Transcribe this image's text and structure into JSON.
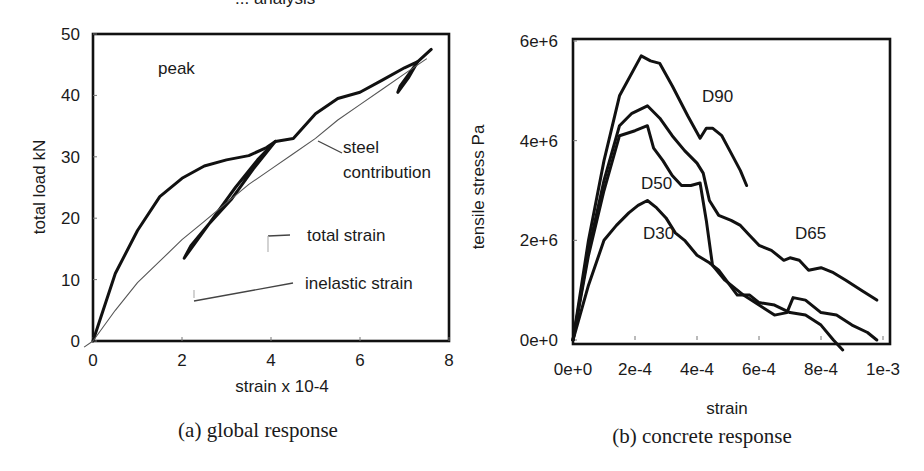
{
  "page_title_fragment": "... analysis",
  "chart_data": [
    {
      "type": "line",
      "caption": "(a) global response",
      "xlabel": "strain x 10-4",
      "ylabel": "total load  kN",
      "xlim": [
        0,
        8
      ],
      "ylim": [
        0,
        50
      ],
      "xticks": [
        "0",
        "2",
        "4",
        "6",
        "8"
      ],
      "yticks": [
        "0",
        "10",
        "20",
        "30",
        "40",
        "50"
      ],
      "grid": false,
      "annotations": [
        "peak",
        "steel contribution",
        "total strain",
        "inelastic strain"
      ],
      "series": [
        {
          "name": "total strain",
          "style": "thick",
          "x": [
            0,
            0.5,
            1.0,
            1.5,
            2.0,
            2.5,
            3.0,
            3.5,
            3.9,
            4.1,
            4.5,
            5.0,
            5.5,
            6.0,
            6.5,
            7.0,
            7.3,
            7.6
          ],
          "y": [
            0,
            11,
            18,
            23.5,
            26.5,
            28.5,
            29.5,
            30.2,
            31.5,
            32.5,
            33,
            37,
            39.5,
            40.5,
            42.5,
            44.5,
            45.5,
            47.5
          ]
        },
        {
          "name": "inelastic strain (unload/reload loop 1)",
          "style": "thick",
          "x": [
            4.1,
            3.6,
            3.1,
            2.6,
            2.2,
            2.05,
            2.2,
            2.7,
            3.2,
            3.7,
            4.1
          ],
          "y": [
            32.5,
            28,
            23,
            19,
            15.5,
            13.5,
            15,
            20,
            25,
            29.5,
            32.5
          ]
        },
        {
          "name": "inelastic strain (unload/reload loop 2)",
          "style": "thick",
          "x": [
            7.3,
            7.1,
            6.85,
            6.9,
            7.15,
            7.3
          ],
          "y": [
            45.5,
            43,
            40.5,
            41.5,
            44,
            45.5
          ]
        },
        {
          "name": "steel contribution",
          "style": "thin",
          "x": [
            -0.2,
            0,
            0.5,
            1.0,
            1.5,
            2.0,
            2.5,
            3.0,
            3.5,
            4.0,
            4.5,
            5.0,
            5.5,
            6.0,
            6.5,
            7.0,
            7.5
          ],
          "y": [
            -1,
            0,
            5,
            9.5,
            13,
            16.5,
            19.5,
            22.5,
            25.5,
            28,
            30.5,
            33,
            36,
            38.5,
            41,
            43.5,
            46
          ]
        }
      ]
    },
    {
      "type": "line",
      "caption": "(b) concrete response",
      "xlabel": "strain",
      "ylabel": "tensile  stress Pa",
      "xlim": [
        0,
        0.001
      ],
      "ylim": [
        0,
        6000000
      ],
      "xticks": [
        "0e+0",
        "2e-4",
        "4e-4",
        "6e-4",
        "8e-4",
        "1e-3"
      ],
      "yticks": [
        "0e+0",
        "2e+6",
        "4e+6",
        "6e+6"
      ],
      "grid": false,
      "series": [
        {
          "name": "D90",
          "x": [
            0,
            5e-05,
            0.0001,
            0.00015,
            0.00022,
            0.00025,
            0.00028,
            0.00032,
            0.00037,
            0.00041,
            0.00043,
            0.00045,
            0.00048,
            0.00051,
            0.00054,
            0.00056
          ],
          "y": [
            0,
            2000000,
            3600000,
            4900000,
            5700000,
            5600000,
            5550000,
            5100000,
            4500000,
            4050000,
            4250000,
            4250000,
            4100000,
            3750000,
            3400000,
            3100000
          ]
        },
        {
          "name": "D65",
          "x": [
            0,
            5e-05,
            0.0001,
            0.00015,
            0.00019,
            0.00024,
            0.00028,
            0.00032,
            0.00036,
            0.0004,
            0.00042,
            0.00044,
            0.00047,
            0.00051,
            0.00054,
            0.00057,
            0.0006,
            0.00064,
            0.00068,
            0.0007,
            0.00073,
            0.00076,
            0.0008,
            0.00084,
            0.00088,
            0.00093,
            0.00098
          ],
          "y": [
            0,
            1800000,
            3200000,
            4300000,
            4550000,
            4700000,
            4450000,
            4100000,
            3800000,
            3550000,
            3350000,
            2800000,
            2500000,
            2400000,
            2300000,
            2100000,
            1900000,
            1800000,
            1600000,
            1650000,
            1600000,
            1400000,
            1450000,
            1350000,
            1200000,
            1000000,
            800000
          ]
        },
        {
          "name": "D50",
          "x": [
            0,
            5e-05,
            0.0001,
            0.00015,
            0.0002,
            0.00024,
            0.00026,
            0.00029,
            0.00032,
            0.00035,
            0.00038,
            0.00041,
            0.00043,
            0.00045,
            0.00049,
            0.00055,
            0.0006,
            0.00065,
            0.00069,
            0.00071,
            0.00075,
            0.0008,
            0.00085,
            0.0009,
            0.00095,
            0.00098
          ],
          "y": [
            0,
            1700000,
            3000000,
            4100000,
            4200000,
            4300000,
            3850000,
            3600000,
            3300000,
            3100000,
            3100000,
            3150000,
            2400000,
            1500000,
            1200000,
            900000,
            700000,
            500000,
            550000,
            850000,
            800000,
            550000,
            500000,
            300000,
            150000,
            0
          ]
        },
        {
          "name": "D30",
          "x": [
            0,
            5e-05,
            0.0001,
            0.00014,
            0.00018,
            0.00021,
            0.00024,
            0.00027,
            0.0003,
            0.00033,
            0.00036,
            0.0004,
            0.00044,
            0.00047,
            0.0005,
            0.00053,
            0.00057,
            0.0006,
            0.00065,
            0.0007,
            0.00075,
            0.0008,
            0.00084,
            0.00087
          ],
          "y": [
            0,
            1100000,
            2000000,
            2300000,
            2550000,
            2700000,
            2800000,
            2650000,
            2450000,
            2150000,
            2000000,
            1700000,
            1550000,
            1400000,
            1150000,
            900000,
            900000,
            750000,
            700000,
            550000,
            500000,
            300000,
            0,
            -200000
          ]
        }
      ]
    }
  ]
}
